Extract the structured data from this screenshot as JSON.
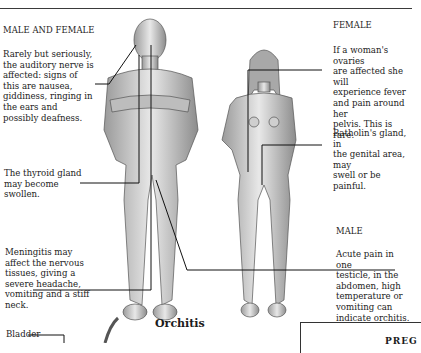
{
  "left": {
    "heading": "MALE AND FEMALE",
    "auditory": "Rarely but seriously,\nthe auditory nerve is\naffected: signs of\nthis are nausea,\ngiddiness, ringing in\nthe ears and\npossibly deafness.",
    "thyroid": "The thyroid gland\nmay become\nswollen.",
    "meningitis": "Meningitis may\naffect the nervous\ntissues, giving a\nsevere headache,\nvomiting and a stiff\nneck.",
    "bladder": "Bladder"
  },
  "right": {
    "female_heading": "FEMALE",
    "ovaries": "If a woman's ovaries\nare affected she will\nexperience fever\nand pain around her\npelvis. This is rare.",
    "batholin": "Batholin's gland, in\nthe genital area, may\nswell or be painful.",
    "male_heading": "MALE",
    "orchitis_signs": "Acute pain in one\ntesticle, in the\nabdomen, high\ntemperature or\nvomiting can\nindicate orchitis."
  },
  "bottom": {
    "orchitis_title": "Orchitis",
    "box_text": "PREG"
  },
  "figures": {
    "male": "male-figure",
    "female": "female-figure"
  }
}
